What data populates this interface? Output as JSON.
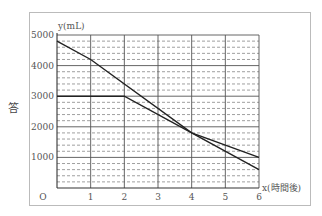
{
  "side_label": "答",
  "chart_data": {
    "type": "line",
    "title": "",
    "xlabel": "x(時間後)",
    "ylabel": "y(mL)",
    "origin_label": "O",
    "xlim": [
      0,
      6
    ],
    "ylim": [
      0,
      5000
    ],
    "x_ticks": [
      "1",
      "2",
      "3",
      "4",
      "5",
      "6"
    ],
    "y_ticks": [
      "1000",
      "2000",
      "3000",
      "4000",
      "5000"
    ],
    "grid": {
      "major_solid": [
        1000,
        2000,
        3000,
        4000,
        5000
      ],
      "minor_dashed_step": 200,
      "vertical_solid_step": 1
    },
    "legend": null,
    "series": [
      {
        "name": "line-a",
        "points": [
          [
            0,
            4800
          ],
          [
            1,
            4200
          ],
          [
            4,
            1800
          ],
          [
            6,
            600
          ]
        ]
      },
      {
        "name": "line-b",
        "points": [
          [
            0,
            3000
          ],
          [
            2,
            3000
          ],
          [
            4,
            1800
          ],
          [
            6,
            1000
          ]
        ]
      }
    ]
  },
  "colors": {
    "line": "#222222",
    "grid_solid": "#555555",
    "grid_dashed": "#777777",
    "frame": "#bbbbbb"
  }
}
